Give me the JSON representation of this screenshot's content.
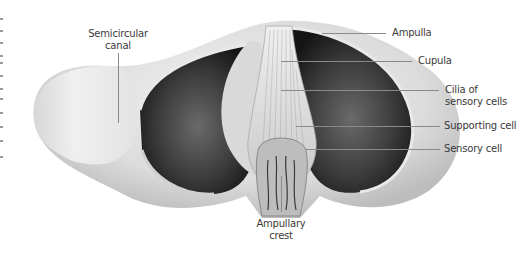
{
  "figure": {
    "labels": {
      "semicircular_canal": [
        "Semicircular",
        "canal"
      ],
      "ampulla": "Ampulla",
      "cupula": "Cupula",
      "cilia": [
        "Cilia of",
        "sensory cells"
      ],
      "supporting_cell": "Supporting cell",
      "sensory_cell": "Sensory cell",
      "ampullary_crest": [
        "Ampullary",
        "crest"
      ]
    },
    "colors": {
      "background": "#ffffff",
      "label_text": "#3a3a3a",
      "leader_line": "#8a8a8a",
      "tissue_light": "#e6e6e6",
      "cavity_dark": "#2a2a2a"
    }
  }
}
